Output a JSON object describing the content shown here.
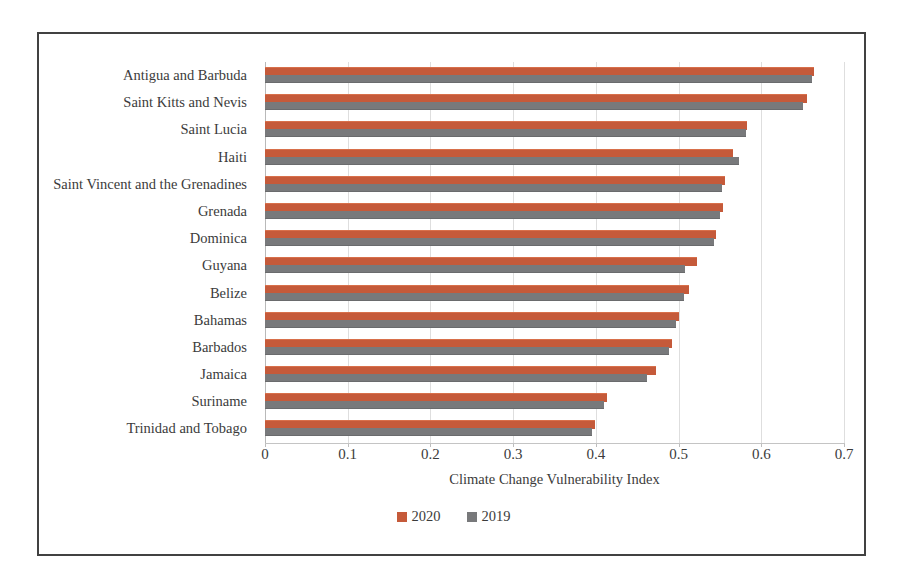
{
  "chart_data": {
    "type": "bar",
    "orientation": "horizontal",
    "title": "",
    "xlabel": "Climate Change Vulnerability Index",
    "ylabel": "",
    "xlim": [
      0,
      0.7
    ],
    "xticks": [
      "0",
      "0.1",
      "0.2",
      "0.3",
      "0.4",
      "0.5",
      "0.6",
      "0.7"
    ],
    "xtick_values": [
      0,
      0.1,
      0.2,
      0.3,
      0.4,
      0.5,
      0.6,
      0.7
    ],
    "grid": true,
    "grid_axis": "x",
    "legend_position": "bottom",
    "categories": [
      "Antigua and Barbuda",
      "Saint Kitts and Nevis",
      "Saint Lucia",
      "Haiti",
      "Saint Vincent and the Grenadines",
      "Grenada",
      "Dominica",
      "Guyana",
      "Belize",
      "Bahamas",
      "Barbados",
      "Jamaica",
      "Suriname",
      "Trinidad and Tobago"
    ],
    "series": [
      {
        "name": "2020",
        "color": "#C55A3A",
        "values": [
          0.664,
          0.655,
          0.583,
          0.566,
          0.556,
          0.554,
          0.545,
          0.522,
          0.513,
          0.5,
          0.492,
          0.473,
          0.414,
          0.399
        ]
      },
      {
        "name": "2019",
        "color": "#78797B",
        "values": [
          0.661,
          0.651,
          0.581,
          0.573,
          0.553,
          0.55,
          0.543,
          0.508,
          0.507,
          0.497,
          0.489,
          0.462,
          0.41,
          0.395
        ]
      }
    ]
  },
  "legend": {
    "items": [
      {
        "label": "2020",
        "color": "#C55A3A"
      },
      {
        "label": "2019",
        "color": "#78797B"
      }
    ]
  },
  "colors": {
    "series_2020": "#C55A3A",
    "series_2019": "#78797B",
    "frame_border": "#414141",
    "gridline": "#dedede",
    "text": "#3b3b3b"
  }
}
